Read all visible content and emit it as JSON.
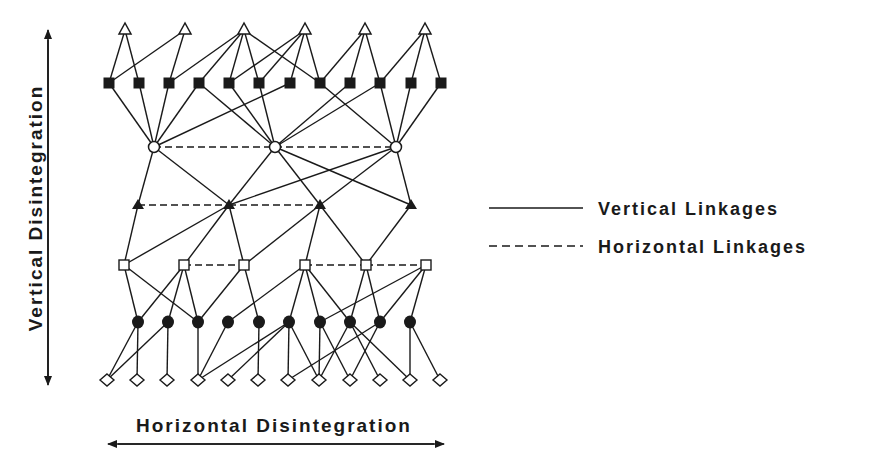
{
  "diagram": {
    "axes": {
      "vertical_label": "Vertical Disintegration",
      "horizontal_label": "Horizontal Disintegration"
    },
    "legend": {
      "items": [
        {
          "label": "Vertical Linkages",
          "style": "solid"
        },
        {
          "label": "Horizontal Linkages",
          "style": "dashed"
        }
      ]
    },
    "layers": [
      {
        "id": "L0",
        "shape": "open-triangle",
        "y": 30,
        "x": [
          125,
          185,
          244,
          305,
          365,
          425
        ]
      },
      {
        "id": "L1",
        "shape": "filled-square",
        "y": 83,
        "x": [
          109,
          139,
          169,
          199,
          229,
          259,
          290,
          320,
          350,
          380,
          411,
          441
        ]
      },
      {
        "id": "L2",
        "shape": "open-circle",
        "y": 147,
        "x": [
          154,
          275,
          396
        ]
      },
      {
        "id": "L3",
        "shape": "filled-triangle",
        "y": 205,
        "x": [
          138,
          229,
          320,
          411
        ]
      },
      {
        "id": "L4",
        "shape": "open-square",
        "y": 265,
        "x": [
          124,
          184,
          244,
          305,
          366,
          426
        ]
      },
      {
        "id": "L5",
        "shape": "filled-circle",
        "y": 322,
        "x": [
          138,
          168,
          198,
          228,
          259,
          289,
          320,
          350,
          380,
          410
        ]
      },
      {
        "id": "L6",
        "shape": "open-diamond",
        "y": 380,
        "x": [
          107,
          137,
          167,
          198,
          228,
          258,
          288,
          319,
          350,
          380,
          410,
          440
        ]
      }
    ],
    "vertical_links": [
      [
        "L0",
        0,
        "L1",
        0
      ],
      [
        "L0",
        0,
        "L1",
        1
      ],
      [
        "L0",
        1,
        "L1",
        0
      ],
      [
        "L0",
        1,
        "L1",
        2
      ],
      [
        "L0",
        2,
        "L1",
        2
      ],
      [
        "L0",
        2,
        "L1",
        3
      ],
      [
        "L0",
        2,
        "L1",
        4
      ],
      [
        "L0",
        2,
        "L1",
        5
      ],
      [
        "L0",
        2,
        "L1",
        7
      ],
      [
        "L0",
        3,
        "L1",
        4
      ],
      [
        "L0",
        3,
        "L1",
        5
      ],
      [
        "L0",
        3,
        "L1",
        6
      ],
      [
        "L0",
        3,
        "L1",
        7
      ],
      [
        "L0",
        4,
        "L1",
        7
      ],
      [
        "L0",
        4,
        "L1",
        8
      ],
      [
        "L0",
        4,
        "L1",
        9
      ],
      [
        "L0",
        5,
        "L1",
        9
      ],
      [
        "L0",
        5,
        "L1",
        10
      ],
      [
        "L0",
        5,
        "L1",
        11
      ],
      [
        "L1",
        0,
        "L2",
        0
      ],
      [
        "L1",
        1,
        "L2",
        0
      ],
      [
        "L1",
        2,
        "L2",
        0
      ],
      [
        "L1",
        3,
        "L2",
        0
      ],
      [
        "L1",
        6,
        "L2",
        0
      ],
      [
        "L1",
        3,
        "L2",
        1
      ],
      [
        "L1",
        4,
        "L2",
        1
      ],
      [
        "L1",
        5,
        "L2",
        1
      ],
      [
        "L1",
        8,
        "L2",
        1
      ],
      [
        "L1",
        9,
        "L2",
        1
      ],
      [
        "L1",
        7,
        "L2",
        2
      ],
      [
        "L1",
        9,
        "L2",
        2
      ],
      [
        "L1",
        10,
        "L2",
        2
      ],
      [
        "L1",
        11,
        "L2",
        2
      ],
      [
        "L2",
        0,
        "L3",
        0
      ],
      [
        "L2",
        0,
        "L3",
        1
      ],
      [
        "L2",
        1,
        "L3",
        1
      ],
      [
        "L2",
        1,
        "L3",
        2
      ],
      [
        "L2",
        1,
        "L3",
        3
      ],
      [
        "L2",
        2,
        "L3",
        1
      ],
      [
        "L2",
        2,
        "L3",
        2
      ],
      [
        "L2",
        2,
        "L3",
        3
      ],
      [
        "L3",
        0,
        "L4",
        0
      ],
      [
        "L3",
        1,
        "L4",
        0
      ],
      [
        "L3",
        1,
        "L4",
        1
      ],
      [
        "L3",
        1,
        "L4",
        2
      ],
      [
        "L3",
        2,
        "L4",
        2
      ],
      [
        "L3",
        2,
        "L4",
        3
      ],
      [
        "L3",
        2,
        "L4",
        4
      ],
      [
        "L3",
        3,
        "L4",
        4
      ],
      [
        "L4",
        0,
        "L5",
        0
      ],
      [
        "L4",
        0,
        "L5",
        2
      ],
      [
        "L4",
        1,
        "L5",
        0
      ],
      [
        "L4",
        1,
        "L5",
        1
      ],
      [
        "L4",
        1,
        "L5",
        2
      ],
      [
        "L4",
        2,
        "L5",
        2
      ],
      [
        "L4",
        2,
        "L5",
        4
      ],
      [
        "L4",
        3,
        "L5",
        3
      ],
      [
        "L4",
        3,
        "L5",
        5
      ],
      [
        "L4",
        3,
        "L5",
        6
      ],
      [
        "L4",
        3,
        "L5",
        7
      ],
      [
        "L4",
        4,
        "L5",
        7
      ],
      [
        "L4",
        4,
        "L5",
        8
      ],
      [
        "L4",
        5,
        "L5",
        6
      ],
      [
        "L4",
        5,
        "L5",
        8
      ],
      [
        "L4",
        5,
        "L5",
        9
      ],
      [
        "L5",
        0,
        "L6",
        0
      ],
      [
        "L5",
        0,
        "L6",
        1
      ],
      [
        "L5",
        1,
        "L6",
        0
      ],
      [
        "L5",
        1,
        "L6",
        2
      ],
      [
        "L5",
        2,
        "L6",
        3
      ],
      [
        "L5",
        3,
        "L6",
        3
      ],
      [
        "L5",
        4,
        "L6",
        5
      ],
      [
        "L5",
        5,
        "L6",
        3
      ],
      [
        "L5",
        5,
        "L6",
        4
      ],
      [
        "L5",
        5,
        "L6",
        6
      ],
      [
        "L5",
        5,
        "L6",
        7
      ],
      [
        "L5",
        6,
        "L6",
        7
      ],
      [
        "L5",
        6,
        "L6",
        8
      ],
      [
        "L5",
        7,
        "L6",
        7
      ],
      [
        "L5",
        7,
        "L6",
        9
      ],
      [
        "L5",
        7,
        "L6",
        10
      ],
      [
        "L5",
        8,
        "L6",
        6
      ],
      [
        "L5",
        8,
        "L6",
        8
      ],
      [
        "L5",
        9,
        "L6",
        10
      ],
      [
        "L5",
        9,
        "L6",
        11
      ]
    ],
    "horizontal_links": [
      [
        "L2",
        0,
        "L2",
        1
      ],
      [
        "L2",
        1,
        "L2",
        2
      ],
      [
        "L3",
        0,
        "L3",
        1
      ],
      [
        "L3",
        1,
        "L3",
        2
      ],
      [
        "L4",
        1,
        "L4",
        2
      ],
      [
        "L4",
        3,
        "L4",
        4
      ],
      [
        "L4",
        4,
        "L4",
        5
      ]
    ]
  }
}
